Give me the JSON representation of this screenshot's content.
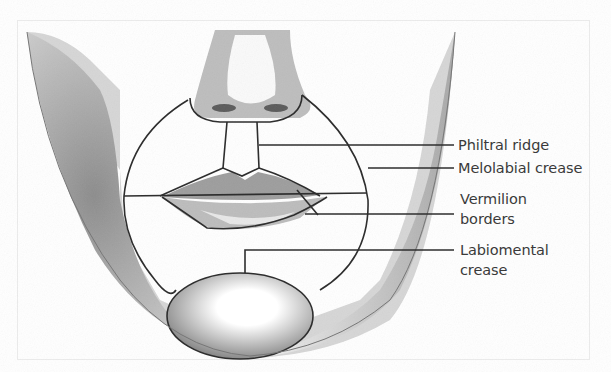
{
  "diagram": {
    "labels": [
      {
        "id": "philtral-ridge",
        "text": "Philtral ridge",
        "x": 458,
        "y": 135
      },
      {
        "id": "melolabial-crease",
        "text": "Melolabial crease",
        "x": 458,
        "y": 158
      },
      {
        "id": "vermilion-borders-1",
        "text": "Vermilion",
        "x": 460,
        "y": 192
      },
      {
        "id": "vermilion-borders-2",
        "text": "borders",
        "x": 460,
        "y": 212
      },
      {
        "id": "labiomental-crease-1",
        "text": "Labiomental",
        "x": 460,
        "y": 238
      },
      {
        "id": "labiomental-crease-2",
        "text": "crease",
        "x": 460,
        "y": 258
      }
    ],
    "colors": {
      "line": "#2e2e2e",
      "text": "#3a3a3a",
      "shading": "#9a9a9a"
    }
  }
}
